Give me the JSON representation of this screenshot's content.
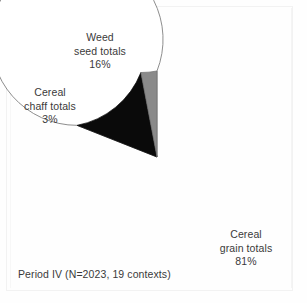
{
  "figure": {
    "caption": "Period IV (N=2023, 19 contexts)"
  },
  "labels": {
    "weed": {
      "line1": "Weed",
      "line2": "seed totals",
      "value": "16%"
    },
    "chaff": {
      "line1": "Cereal",
      "line2": "chaff totals",
      "value": "3%"
    },
    "grain": {
      "line1": "Cereal",
      "line2": "grain totals",
      "value": "81%"
    }
  },
  "chart_data": {
    "type": "pie",
    "title": "",
    "subtitle": "",
    "annotations": [
      "Period IV (N=2023, 19 contexts)"
    ],
    "legend_position": "none",
    "grid": false,
    "start_angle_deg": 90,
    "direction": "counterclockwise",
    "categories": [
      "Cereal grain totals",
      "Weed seed totals",
      "Cereal chaff totals"
    ],
    "values": [
      81,
      16,
      3
    ],
    "unit": "%",
    "total_n": 2023,
    "contexts": 19,
    "slices": [
      {
        "label": "Cereal grain totals",
        "value": 81,
        "display": "81%",
        "color": "#ffffff",
        "stroke": "#808080"
      },
      {
        "label": "Weed seed totals",
        "value": 16,
        "display": "16%",
        "color": "#0a0a0a",
        "stroke": "#0a0a0a"
      },
      {
        "label": "Cereal chaff totals",
        "value": 3,
        "display": "3%",
        "color": "#8a8a8a",
        "stroke": "#6f6f6f"
      }
    ],
    "geometry": {
      "center_x": 157,
      "center_y": 157,
      "radius": 86
    }
  }
}
